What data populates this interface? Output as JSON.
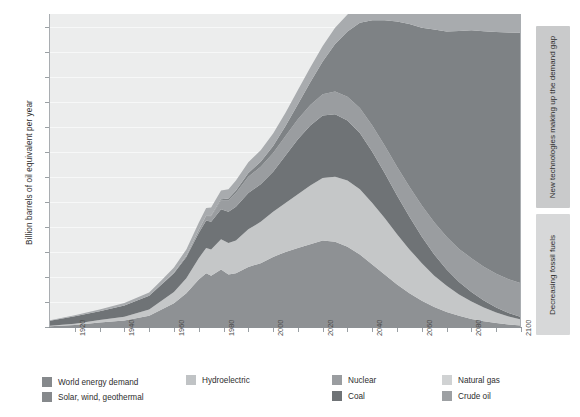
{
  "chart_data": {
    "type": "area",
    "title": "",
    "subtitle": "",
    "xlabel": "",
    "ylabel": "Billion barrels of oil equivalent per year",
    "xlim": [
      1910,
      2100
    ],
    "ylim": [
      0,
      125
    ],
    "ytick_step": 10,
    "grid": true,
    "legend_position": "bottom",
    "ytick_labels": [
      "0",
      "10",
      "20",
      "30",
      "40",
      "50",
      "60",
      "70",
      "80",
      "90",
      "100",
      "110",
      "120"
    ],
    "ytick_values": [
      0,
      10,
      20,
      30,
      40,
      50,
      60,
      70,
      80,
      90,
      100,
      110,
      120
    ],
    "xtick_labels": [
      "1920",
      "1940",
      "1960",
      "1980",
      "2000",
      "2020",
      "2040",
      "2060",
      "2080",
      "2100"
    ],
    "xtick_values": [
      1920,
      1940,
      1960,
      1980,
      2000,
      2020,
      2040,
      2060,
      2080,
      2100
    ],
    "x": [
      1910,
      1920,
      1930,
      1940,
      1950,
      1955,
      1960,
      1965,
      1970,
      1973,
      1975,
      1979,
      1982,
      1985,
      1990,
      1995,
      2000,
      2005,
      2010,
      2015,
      2020,
      2025,
      2030,
      2035,
      2040,
      2045,
      2050,
      2055,
      2060,
      2065,
      2070,
      2075,
      2080,
      2085,
      2090,
      2095,
      2100
    ],
    "stack_order_bottom_to_top": [
      "Crude oil",
      "Natural gas",
      "Coal",
      "Nuclear",
      "Solar, wind, geothermal",
      "Hydroelectric"
    ],
    "series": [
      {
        "name": "Crude oil",
        "color": "#8e9194",
        "values": [
          0.3,
          0.8,
          1.8,
          2.6,
          4.5,
          7.0,
          9.5,
          13.5,
          19.0,
          21.5,
          20.5,
          23.0,
          21.0,
          21.5,
          24.0,
          25.5,
          28.0,
          30.0,
          31.5,
          33.0,
          34.5,
          34.0,
          32.0,
          29.0,
          25.0,
          21.0,
          17.0,
          13.5,
          10.5,
          8.0,
          6.0,
          4.5,
          3.2,
          2.3,
          1.6,
          1.0,
          0.6
        ]
      },
      {
        "name": "Natural gas",
        "color": "#c5c7c8",
        "values": [
          0.2,
          0.5,
          1.0,
          1.5,
          2.5,
          3.5,
          4.5,
          6.0,
          8.5,
          10.0,
          10.5,
          12.0,
          12.5,
          13.0,
          15.0,
          16.5,
          18.0,
          19.5,
          21.5,
          23.5,
          25.0,
          26.0,
          26.5,
          26.0,
          24.5,
          22.5,
          20.0,
          17.5,
          15.0,
          12.5,
          10.5,
          8.5,
          7.0,
          5.5,
          4.2,
          3.2,
          2.4
        ]
      },
      {
        "name": "Coal",
        "color": "#6f7376",
        "values": [
          2.0,
          3.0,
          3.5,
          4.5,
          5.5,
          6.5,
          7.5,
          8.5,
          10.0,
          11.0,
          11.0,
          12.0,
          12.5,
          13.5,
          14.5,
          15.0,
          16.0,
          19.0,
          22.0,
          24.0,
          25.0,
          25.0,
          24.0,
          22.5,
          20.5,
          18.0,
          15.5,
          13.0,
          10.5,
          8.5,
          6.5,
          5.0,
          3.8,
          2.8,
          2.0,
          1.4,
          1.0
        ]
      },
      {
        "name": "Nuclear",
        "color": "#9a9da0",
        "values": [
          0,
          0,
          0,
          0,
          0,
          0.1,
          0.3,
          0.6,
          1.2,
          1.8,
          2.2,
          3.5,
          4.5,
          5.5,
          6.5,
          7.0,
          7.5,
          7.8,
          8.0,
          8.2,
          8.5,
          9.0,
          9.5,
          10.0,
          10.5,
          11.0,
          11.5,
          12.0,
          12.5,
          12.8,
          13.0,
          13.2,
          13.5,
          13.5,
          13.5,
          13.5,
          13.5
        ]
      },
      {
        "name": "Solar, wind, geothermal",
        "color": "#7e8285",
        "values": [
          0,
          0,
          0,
          0,
          0,
          0,
          0,
          0,
          0.1,
          0.2,
          0.3,
          0.5,
          0.8,
          1.0,
          1.5,
          2.0,
          2.8,
          4.0,
          6.0,
          9.0,
          13.0,
          19.0,
          26.0,
          34.0,
          42.0,
          50.0,
          58.0,
          65.0,
          71.0,
          77.0,
          82.0,
          87.0,
          91.0,
          94.0,
          96.5,
          98.5,
          100.0
        ]
      },
      {
        "name": "Hydroelectric",
        "color": "#a8abae",
        "values": [
          0.2,
          0.4,
          0.7,
          1.0,
          1.3,
          1.6,
          2.0,
          2.4,
          2.8,
          3.0,
          3.2,
          3.5,
          3.7,
          4.0,
          4.3,
          4.6,
          5.0,
          5.3,
          5.6,
          5.9,
          6.2,
          6.5,
          6.8,
          7.0,
          7.2,
          7.4,
          7.6,
          7.8,
          8.0,
          8.1,
          8.2,
          8.3,
          8.4,
          8.5,
          8.6,
          8.7,
          8.8
        ]
      }
    ],
    "demand_line": {
      "name": "World energy demand",
      "color": "#86898c",
      "values": [
        2.7,
        4.7,
        7.0,
        9.6,
        13.8,
        18.7,
        23.8,
        31.0,
        41.6,
        47.5,
        47.7,
        54.5,
        55.0,
        58.5,
        65.8,
        70.6,
        77.3,
        85.6,
        94.6,
        103.6,
        112.2,
        119.5,
        124.8,
        128.5,
        129.7,
        129.9,
        129.6,
        128.8,
        127.5,
        126.9,
        126.2,
        126.5,
        126.9,
        126.6,
        126.4,
        126.3,
        126.3
      ]
    },
    "annotations": [
      {
        "id": "new-technologies",
        "text": "New technologies making up the demand gap",
        "orientation": "vertical",
        "position": "right",
        "background": "#c9cacb"
      },
      {
        "id": "decreasing-fossil-fuels",
        "text": "Decreasing fossil fuels",
        "orientation": "vertical",
        "position": "right",
        "background": "#d7d8d9"
      }
    ]
  },
  "legend": {
    "items": [
      {
        "label": "World energy demand",
        "color": "#86898c"
      },
      {
        "label": "Hydroelectric",
        "color": "#c0c3c5"
      },
      {
        "label": "Nuclear",
        "color": "#9a9da0"
      },
      {
        "label": "Natural gas",
        "color": "#d0d2d3"
      },
      {
        "label": "Solar, wind, geothermal",
        "color": "#86898c"
      },
      {
        "label": "Coal",
        "color": "#6f7376"
      },
      {
        "label": "Crude oil",
        "color": "#9da0a3"
      }
    ]
  },
  "colors": {
    "plot_background": "#eceded",
    "gridline": "#f7f8f8",
    "axis": "#9aa0a4",
    "text": "#3a3a3a"
  }
}
